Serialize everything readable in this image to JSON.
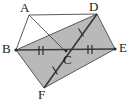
{
  "figure": {
    "background_color": "#ffffff",
    "shaded_fill_color": "#b9b9b9",
    "stroke_color": "#3a3a3a",
    "label_color": "#1a1a1a",
    "vertices": [
      {
        "name": "A",
        "label": "A",
        "x": 29,
        "y": 15,
        "label_x": 20,
        "label_y": 2
      },
      {
        "name": "D",
        "label": "D",
        "x": 97,
        "y": 14,
        "label_x": 89,
        "label_y": 1
      },
      {
        "name": "B",
        "label": "B",
        "x": 16,
        "y": 50,
        "label_x": 3,
        "label_y": 43
      },
      {
        "name": "C",
        "label": "C",
        "x": 66,
        "y": 52,
        "label_x": 64,
        "label_y": 53
      },
      {
        "name": "E",
        "label": "E",
        "x": 115,
        "y": 49,
        "label_x": 118,
        "label_y": 42
      },
      {
        "name": "F",
        "label": "F",
        "x": 44,
        "y": 88,
        "label_x": 38,
        "label_y": 88
      }
    ],
    "shaded_regions": [
      {
        "name": "parallelogram-BDEF",
        "points": "16,50 97,14 115,49 44,88"
      }
    ],
    "segments": [
      {
        "name": "segment-AB",
        "from": "A",
        "to": "B",
        "weight": "thin"
      },
      {
        "name": "segment-AD",
        "from": "A",
        "to": "D",
        "weight": "thin"
      },
      {
        "name": "segment-AC",
        "from": "A",
        "to": "C",
        "weight": "thin"
      },
      {
        "name": "segment-BD",
        "from": "B",
        "to": "D",
        "weight": "thin"
      },
      {
        "name": "segment-BE",
        "from": "B",
        "to": "E",
        "weight": "thick"
      },
      {
        "name": "segment-BF",
        "from": "B",
        "to": "F",
        "weight": "thin"
      },
      {
        "name": "segment-DE",
        "from": "D",
        "to": "E",
        "weight": "thin"
      },
      {
        "name": "segment-DF",
        "from": "D",
        "to": "F",
        "weight": "thick"
      },
      {
        "name": "segment-FE",
        "from": "F",
        "to": "E",
        "weight": "thin"
      }
    ],
    "tick_marks": [
      {
        "name": "tick-BC",
        "segment": "BC",
        "count": 2,
        "x": 41,
        "y": 51
      },
      {
        "name": "tick-CE",
        "segment": "CE",
        "count": 2,
        "x": 90,
        "y": 50
      },
      {
        "name": "tick-CF",
        "segment": "CF",
        "count": 1,
        "x": 55,
        "y": 70
      },
      {
        "name": "tick-CD",
        "segment": "CD",
        "count": 1,
        "x": 81,
        "y": 33
      }
    ]
  }
}
